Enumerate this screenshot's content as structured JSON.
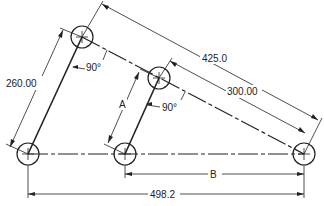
{
  "diagram": {
    "type": "linkage-dimension-drawing",
    "holes": [
      {
        "id": "top-left",
        "cx": 82,
        "cy": 37
      },
      {
        "id": "middle",
        "cx": 159,
        "cy": 78
      },
      {
        "id": "bottom-left",
        "cx": 28,
        "cy": 154
      },
      {
        "id": "bottom-middle",
        "cx": 125,
        "cy": 154
      },
      {
        "id": "bottom-right",
        "cx": 304,
        "cy": 154
      }
    ],
    "dimensions": {
      "left_link": "260.00",
      "overall_diagonal": "425.0",
      "inner_diagonal": "300.00",
      "middle_link": "A",
      "bottom_partial": "B",
      "bottom_overall": "498.2"
    },
    "angles": {
      "top_angle": "90°",
      "middle_angle": "90°"
    },
    "colors": {
      "line": "#222222",
      "background": "#ffffff"
    }
  }
}
